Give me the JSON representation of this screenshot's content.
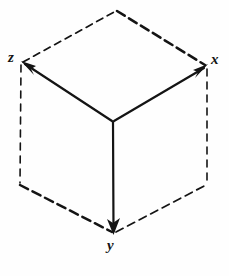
{
  "figure": {
    "style": "hand-drawn line diagram",
    "background_color": "#fefefe",
    "ink_color": "#141414",
    "canvas": {
      "width": 229,
      "height": 276
    }
  },
  "labels": {
    "x": "x",
    "y": "y",
    "z": "z"
  },
  "geometry": {
    "origin": {
      "x": 113,
      "y": 122
    },
    "vertices": {
      "top": {
        "x": 116,
        "y": 10
      },
      "left": {
        "x": 22,
        "y": 63
      },
      "right": {
        "x": 206,
        "y": 66
      },
      "bottom_left": {
        "x": 20,
        "y": 184
      },
      "bottom_right": {
        "x": 207,
        "y": 184
      },
      "bottom": {
        "x": 114,
        "y": 233
      }
    },
    "solid_axes": [
      {
        "name": "x-axis",
        "from": "origin",
        "to": "right",
        "arrow": true
      },
      {
        "name": "y-axis",
        "from": "origin",
        "to": "bottom",
        "arrow": true
      },
      {
        "name": "z-axis",
        "from": "origin",
        "to": "left",
        "arrow": true
      }
    ],
    "dashed_edges": [
      {
        "name": "edge-left-top",
        "from": "left",
        "to": "top"
      },
      {
        "name": "edge-top-right",
        "from": "top",
        "to": "right"
      },
      {
        "name": "edge-left-bottomleft",
        "from": "left",
        "to": "bottom_left"
      },
      {
        "name": "edge-right-bottomright",
        "from": "right",
        "to": "bottom_right"
      },
      {
        "name": "edge-bottomleft-bottom",
        "from": "bottom_left",
        "to": "bottom"
      },
      {
        "name": "edge-bottom-bottomright",
        "from": "bottom",
        "to": "bottom_right"
      }
    ]
  }
}
